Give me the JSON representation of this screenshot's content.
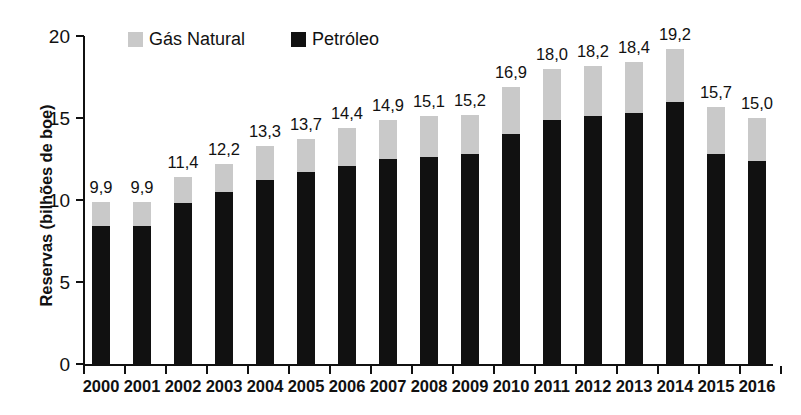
{
  "chart_data": {
    "type": "bar",
    "subtype": "stacked-bar",
    "title": "",
    "xlabel": "",
    "ylabel": "Reservas (bilhões de boe)",
    "ylim": [
      0,
      20
    ],
    "yticks": [
      0,
      5,
      10,
      15,
      20
    ],
    "ytick_labels": [
      "0",
      "5",
      "10",
      "15",
      "20"
    ],
    "grid": false,
    "legend_position": "top-left",
    "decimal_separator": ",",
    "categories": [
      "2000",
      "2001",
      "2002",
      "2003",
      "2004",
      "2005",
      "2006",
      "2007",
      "2008",
      "2009",
      "2010",
      "2011",
      "2012",
      "2013",
      "2014",
      "2015",
      "2016"
    ],
    "series": [
      {
        "name": "Petróleo",
        "color": "#111111",
        "values": [
          8.4,
          8.4,
          9.8,
          10.5,
          11.2,
          11.7,
          12.1,
          12.5,
          12.6,
          12.8,
          14.0,
          14.9,
          15.1,
          15.3,
          16.0,
          12.8,
          12.4
        ]
      },
      {
        "name": "Gás Natural",
        "color": "#c9c9c9",
        "values": [
          1.5,
          1.5,
          1.6,
          1.7,
          2.1,
          2.0,
          2.3,
          2.4,
          2.5,
          2.4,
          2.9,
          3.1,
          3.1,
          3.1,
          3.2,
          2.9,
          2.6
        ]
      }
    ],
    "totals": [
      9.9,
      9.9,
      11.4,
      12.2,
      13.3,
      13.7,
      14.4,
      14.9,
      15.1,
      15.2,
      16.9,
      18.0,
      18.2,
      18.4,
      19.2,
      15.7,
      15.0
    ],
    "total_labels": [
      "9,9",
      "9,9",
      "11,4",
      "12,2",
      "13,3",
      "13,7",
      "14,4",
      "14,9",
      "15,1",
      "15,2",
      "16,9",
      "18,0",
      "18,2",
      "18,4",
      "19,2",
      "15,7",
      "15,0"
    ]
  },
  "legend": {
    "items": [
      {
        "label": "Gás Natural",
        "swatch": "gas"
      },
      {
        "label": "Petróleo",
        "swatch": "oil"
      }
    ]
  },
  "axes": {
    "y_title": "Reservas (bilhões de boe)"
  }
}
